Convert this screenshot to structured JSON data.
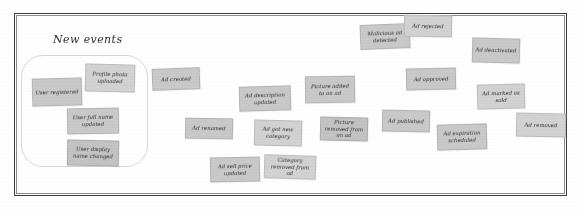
{
  "board": {
    "group_label": "New events",
    "frame_color": "#3d3d3d",
    "lasso_color": "#d8d8d8",
    "note_color": "#c9c9c9",
    "background_color": "#ffffff"
  },
  "notes": [
    {
      "label": "User registered",
      "x": 32,
      "y": 78,
      "w": 50,
      "h": 28,
      "rot": -1.5,
      "tone": ""
    },
    {
      "label": "Profile photo uploaded",
      "x": 85,
      "y": 64,
      "w": 50,
      "h": 28,
      "rot": 1.5,
      "tone": "light"
    },
    {
      "label": "User full name updated",
      "x": 67,
      "y": 108,
      "w": 52,
      "h": 26,
      "rot": -1.0,
      "tone": ""
    },
    {
      "label": "User display name changed",
      "x": 67,
      "y": 140,
      "w": 52,
      "h": 26,
      "rot": 1.2,
      "tone": "dim"
    },
    {
      "label": "Ad created",
      "x": 152,
      "y": 68,
      "w": 48,
      "h": 22,
      "rot": -2.0,
      "tone": ""
    },
    {
      "label": "Ad renamed",
      "x": 185,
      "y": 118,
      "w": 48,
      "h": 21,
      "rot": 1.0,
      "tone": ""
    },
    {
      "label": "Ad description updated",
      "x": 239,
      "y": 86,
      "w": 52,
      "h": 25,
      "rot": -1.6,
      "tone": ""
    },
    {
      "label": "Ad got new category",
      "x": 254,
      "y": 120,
      "w": 48,
      "h": 26,
      "rot": 1.4,
      "tone": "light"
    },
    {
      "label": "Ad sell price updated",
      "x": 210,
      "y": 157,
      "w": 50,
      "h": 25,
      "rot": -1.2,
      "tone": ""
    },
    {
      "label": "Category removed from ad",
      "x": 264,
      "y": 155,
      "w": 52,
      "h": 24,
      "rot": 1.8,
      "tone": "light"
    },
    {
      "label": "Picture added to an ad",
      "x": 305,
      "y": 76,
      "w": 50,
      "h": 27,
      "rot": -1.0,
      "tone": ""
    },
    {
      "label": "Picture removed from an ad",
      "x": 320,
      "y": 117,
      "w": 48,
      "h": 24,
      "rot": 1.3,
      "tone": "dim"
    },
    {
      "label": "Malicious ad detected",
      "x": 360,
      "y": 24,
      "w": 50,
      "h": 25,
      "rot": -2.2,
      "tone": ""
    },
    {
      "label": "Ad rejected",
      "x": 404,
      "y": 15,
      "w": 48,
      "h": 22,
      "rot": 1.0,
      "tone": "light"
    },
    {
      "label": "Ad approved",
      "x": 406,
      "y": 68,
      "w": 50,
      "h": 22,
      "rot": -1.2,
      "tone": ""
    },
    {
      "label": "Ad deactivated",
      "x": 472,
      "y": 38,
      "w": 48,
      "h": 25,
      "rot": 1.5,
      "tone": ""
    },
    {
      "label": "Ad marked as sold",
      "x": 477,
      "y": 84,
      "w": 48,
      "h": 25,
      "rot": -1.4,
      "tone": "light"
    },
    {
      "label": "Ad published",
      "x": 382,
      "y": 110,
      "w": 48,
      "h": 22,
      "rot": 1.2,
      "tone": ""
    },
    {
      "label": "Ad expiration scheduled",
      "x": 437,
      "y": 124,
      "w": 50,
      "h": 26,
      "rot": -1.6,
      "tone": ""
    },
    {
      "label": "Ad removed",
      "x": 516,
      "y": 113,
      "w": 50,
      "h": 24,
      "rot": 1.1,
      "tone": "light"
    }
  ]
}
